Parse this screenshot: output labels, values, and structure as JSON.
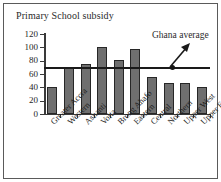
{
  "chart_data": {
    "type": "bar",
    "title": "Primary School subsidy",
    "xlabel": "",
    "ylabel": "",
    "ylim": [
      0,
      120
    ],
    "yticks": [
      0,
      20,
      40,
      60,
      80,
      100,
      120
    ],
    "grid": false,
    "legend": null,
    "categories": [
      "Greater Accra",
      "Western",
      "Ashanti",
      "Volta",
      "Brong Ahafo",
      "Eastern",
      "Central",
      "Northern",
      "Upper West",
      "Upper East"
    ],
    "values": [
      41,
      69,
      75,
      101,
      81,
      98,
      56,
      46,
      47,
      41
    ],
    "annotations": [
      {
        "label": "Ghana average",
        "type": "reference-line",
        "value": 70,
        "marker": "dot-with-arrow"
      }
    ],
    "colors": {
      "bar_fill": "#6f6f6f",
      "bar_edge": "#272727",
      "axis": "#3a3a3a",
      "reference_line": "#1a1a1a",
      "text": "#1e1e1e",
      "background": "#ffffff",
      "frame": "#5a5a5a"
    }
  }
}
